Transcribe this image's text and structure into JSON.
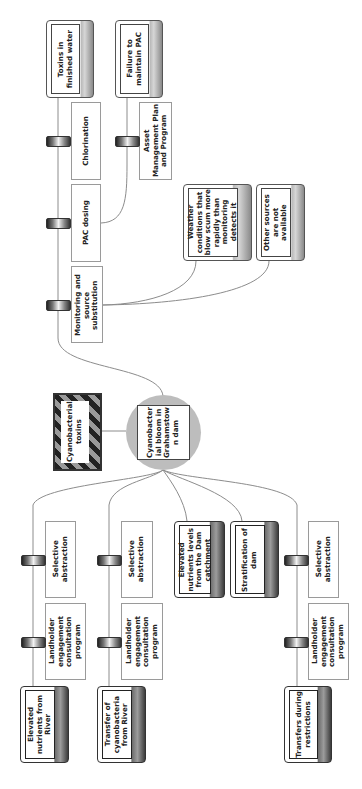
{
  "diagram": {
    "type": "bowtie",
    "orientation": "rotated-90-ccw",
    "hazard": {
      "label": "Cyanobacterial toxins"
    },
    "top_event": {
      "label": "Cyanobacter\nial bloom in\nGrahamstow\nn dam"
    },
    "consequences": [
      {
        "label": "Toxins in\nfinished water",
        "barriers": [
          "Chlorination",
          "PAC dosing",
          "Monitoring and\nsource\nsubstitution"
        ]
      }
    ],
    "escalation_factors": [
      {
        "label": "Failure to\nmaintain PAC",
        "applies_to": "PAC dosing",
        "barriers": [
          "Asset\nManagement Plan\nand Program"
        ]
      },
      {
        "label": "Weather\nconditions that\nblow scum more\nrapidly than\nmonitoring\ndetects it",
        "applies_to": "Monitoring and source substitution",
        "barriers": []
      },
      {
        "label": "Other sources\nare not available",
        "applies_to": "Monitoring and source substitution",
        "barriers": []
      }
    ],
    "threats": [
      {
        "label": "Elevated\nnutrients from\nRiver",
        "barriers": [
          "Selective\nabstraction",
          "Landholder\nengagement\nconsultation\nprogram"
        ]
      },
      {
        "label": "Transfer of\ncyanobacteria\nfrom River",
        "barriers": [
          "Selective\nabstraction",
          "Landholder\nengagement\nconsultation\nprogram"
        ]
      },
      {
        "label": "Elevated\nnutrients levels\nfrom the Dam\ncatchment",
        "barriers": []
      },
      {
        "label": "Stratification of\ndam",
        "barriers": []
      },
      {
        "label": "Transfers during\nrestrictions",
        "barriers": [
          "Selective\nabstraction",
          "Landholder\nengagement\nconsultation\nprogram"
        ]
      }
    ]
  },
  "colors": {
    "line": "#8c8c8c",
    "circle": "#bdbdbd",
    "hazard_stripe_dark": "#222222",
    "hazard_stripe_light": "#9a9a9a"
  }
}
